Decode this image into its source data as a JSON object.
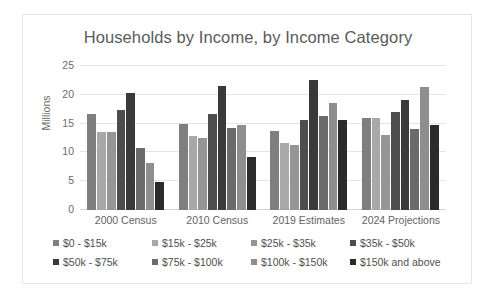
{
  "chart_data": {
    "type": "bar",
    "title": "Households by Income, by Income Category",
    "xlabel": "",
    "ylabel": "Millions",
    "ylim": [
      0,
      25
    ],
    "yticks": [
      0,
      5,
      10,
      15,
      20,
      25
    ],
    "ytick_labels": [
      "0",
      "5",
      "10",
      "15",
      "20",
      "25"
    ],
    "grid": true,
    "legend_position": "bottom",
    "categories": [
      "2000 Census",
      "2010 Census",
      "2019 Estimates",
      "2024 Projections"
    ],
    "series": [
      {
        "name": "$0 - $15k",
        "color": "#7f7f7f",
        "values": [
          16.7,
          15.0,
          13.8,
          16.0
        ]
      },
      {
        "name": "$15k - $25k",
        "color": "#a8a8a8",
        "values": [
          13.6,
          12.9,
          11.6,
          15.9
        ]
      },
      {
        "name": "$25k - $35k",
        "color": "#959595",
        "values": [
          13.6,
          12.5,
          11.3,
          13.1
        ]
      },
      {
        "name": "$35k - $50k",
        "color": "#4d4d4d",
        "values": [
          17.4,
          16.7,
          15.6,
          17.1
        ]
      },
      {
        "name": "$50k - $75k",
        "color": "#3a3a3a",
        "values": [
          20.4,
          21.6,
          22.5,
          19.1
        ]
      },
      {
        "name": "$75k - $100k",
        "color": "#6b6b6b",
        "values": [
          10.8,
          14.3,
          16.4,
          14.0
        ]
      },
      {
        "name": "$100k - $150k",
        "color": "#8e8e8e",
        "values": [
          8.2,
          14.7,
          18.6,
          21.4
        ]
      },
      {
        "name": "$150k and above",
        "color": "#2b2b2b",
        "values": [
          4.8,
          9.2,
          15.6,
          14.7
        ]
      }
    ]
  }
}
